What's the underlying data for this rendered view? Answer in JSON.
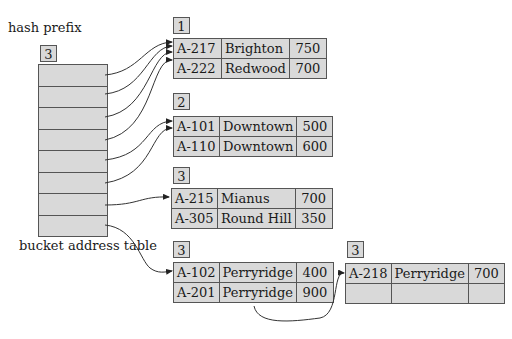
{
  "labels": {
    "hash_prefix": "hash prefix",
    "bucket_address_table": "bucket address table"
  },
  "global_depth": "3",
  "bucket_address_table": {
    "entries": 8
  },
  "buckets": [
    {
      "local_depth": "1",
      "records": [
        [
          "A-217",
          "Brighton",
          "750"
        ],
        [
          "A-222",
          "Redwood",
          "700"
        ]
      ]
    },
    {
      "local_depth": "2",
      "records": [
        [
          "A-101",
          "Downtown",
          "500"
        ],
        [
          "A-110",
          "Downtown",
          "600"
        ]
      ]
    },
    {
      "local_depth": "3",
      "records": [
        [
          "A-215",
          "Mianus",
          "700"
        ],
        [
          "A-305",
          "Round Hill",
          "350"
        ]
      ]
    },
    {
      "local_depth": "3",
      "records": [
        [
          "A-102",
          "Perryridge",
          "400"
        ],
        [
          "A-201",
          "Perryridge",
          "900"
        ]
      ]
    },
    {
      "local_depth": "3",
      "records": [
        [
          "A-218",
          "Perryridge",
          "700"
        ],
        [
          "",
          "",
          ""
        ]
      ]
    }
  ],
  "colors": {
    "fill": "#d9d9d9",
    "border": "#555555",
    "line": "#333333"
  }
}
